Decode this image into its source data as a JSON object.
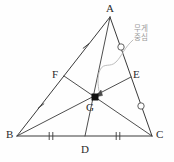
{
  "figure": {
    "type": "geometry-diagram",
    "width": 174,
    "height": 162,
    "background_color": "#fefefe",
    "stroke_color": "#3a3a3a",
    "annotation_color": "#9a9a9a",
    "marker_color": "#111111"
  },
  "vertices": [
    {
      "id": "A",
      "label": "A",
      "x": 110,
      "y": 17,
      "label_x": 106,
      "label_y": 3
    },
    {
      "id": "B",
      "label": "B",
      "x": 17,
      "y": 136,
      "label_x": 6,
      "label_y": 129
    },
    {
      "id": "C",
      "label": "C",
      "x": 152,
      "y": 136,
      "label_x": 156,
      "label_y": 129
    }
  ],
  "midpoints": [
    {
      "id": "D",
      "label": "D",
      "x": 85,
      "y": 136,
      "label_x": 81,
      "label_y": 143,
      "of": "BC"
    },
    {
      "id": "E",
      "label": "E",
      "x": 131,
      "y": 77,
      "label_x": 133,
      "label_y": 69,
      "of": "AC"
    },
    {
      "id": "F",
      "label": "F",
      "x": 64,
      "y": 76,
      "label_x": 52,
      "label_y": 69,
      "of": "AB"
    }
  ],
  "centroid": {
    "id": "G",
    "label": "G",
    "x": 95,
    "y": 97,
    "label_x": 87,
    "label_y": 101,
    "marker": "filled-square",
    "marker_size": 7
  },
  "sides": [
    {
      "id": "AB",
      "from": "A",
      "to": "B"
    },
    {
      "id": "BC",
      "from": "B",
      "to": "C"
    },
    {
      "id": "CA",
      "from": "C",
      "to": "A"
    }
  ],
  "medians": [
    {
      "id": "AD",
      "from": "A",
      "to": "D"
    },
    {
      "id": "BE",
      "from": "B",
      "to": "E"
    },
    {
      "id": "CF",
      "from": "C",
      "to": "F"
    }
  ],
  "tick_marks": [
    {
      "id": "tick-AF",
      "segment": "AF",
      "x": 86,
      "y": 46,
      "angle": 52,
      "count": 1
    },
    {
      "id": "tick-FB",
      "segment": "FB",
      "x": 41,
      "y": 106,
      "angle": 52,
      "count": 1
    },
    {
      "id": "tick-BD",
      "segment": "BD",
      "x": 51,
      "y": 136,
      "angle": 0,
      "count": 2
    },
    {
      "id": "tick-DC",
      "segment": "DC",
      "x": 118,
      "y": 136,
      "angle": 0,
      "count": 2
    }
  ],
  "circle_marks": [
    {
      "id": "circle-AE",
      "segment": "AE",
      "x": 121,
      "y": 47,
      "radius": 3.2
    },
    {
      "id": "circle-EC",
      "segment": "EC",
      "x": 141,
      "y": 106,
      "radius": 3.2
    }
  ],
  "callout": {
    "id": "centroid-callout",
    "line1": "무게",
    "line2": "중심",
    "text_x": 134,
    "text_y": 26,
    "color": "#9a9a9a",
    "leader": {
      "path": "M 133 40 C 124 48 122 56 116 62 C 110 68 104 62 100 70 C 97 77 98 85 99 91",
      "arrow_x": 95,
      "arrow_y": 96
    }
  }
}
